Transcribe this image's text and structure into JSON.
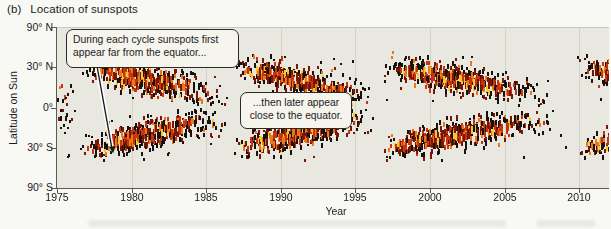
{
  "title": {
    "index": "(b)",
    "text": "Location of sunspots"
  },
  "axes": {
    "y_title": "Latitude on Sun",
    "x_title": "Year",
    "y_labels": [
      "90° N",
      "30° N",
      "0°",
      "30° S",
      "90° S"
    ],
    "x_labels": [
      "1975",
      "1980",
      "1985",
      "1990",
      "1995",
      "2000",
      "2005",
      "2010"
    ]
  },
  "annotations": {
    "first": "During each cycle sunspots first appear far from the equator...",
    "second": "...then later appear close to the equator."
  },
  "chart_data": {
    "type": "heatmap",
    "subtype": "sunspot-butterfly-diagram",
    "xlabel": "Year",
    "ylabel": "Latitude on Sun",
    "x_range": [
      1975,
      2012
    ],
    "x_ticks": [
      1975,
      1980,
      1985,
      1990,
      1995,
      2000,
      2005,
      2010
    ],
    "y_tick_labels": [
      "90° N",
      "30° N",
      "0°",
      "30° S",
      "90° S"
    ],
    "y_tick_latitudes_deg": [
      90,
      30,
      0,
      -30,
      -90
    ],
    "y_scale": "sine-of-latitude",
    "grid": "faint vertical gridlines at each 5-year tick",
    "legend": "none",
    "background": "#e9e8e0",
    "palette": {
      "smallest": "#17120d",
      "small": "#7c1604",
      "medium": "#c63410",
      "large": "#e87818",
      "largest": "#f2c82e"
    },
    "cycles": [
      {
        "cycle": 20,
        "start": 1964.8,
        "end": 1976.8,
        "note": "only low-latitude tail visible at left edge"
      },
      {
        "cycle": 21,
        "start": 1976.3,
        "end": 1986.9,
        "start_latitude_deg": 31,
        "end_latitude_deg": 6
      },
      {
        "cycle": 22,
        "start": 1986.6,
        "end": 1996.6,
        "start_latitude_deg": 31,
        "end_latitude_deg": 6
      },
      {
        "cycle": 23,
        "start": 1996.5,
        "end": 2008.7,
        "start_latitude_deg": 31,
        "end_latitude_deg": 6
      },
      {
        "cycle": 24,
        "start": 2009.6,
        "end": 2020.0,
        "note": "beginning only; chart right edge ~2012"
      }
    ],
    "annotations": [
      {
        "text": "During each cycle sunspots first appear far from the equator...",
        "points_to": {
          "year": 1978.7,
          "latitude_deg": -27
        }
      },
      {
        "text": "...then later appear close to the equator.",
        "location": {
          "year": 1989,
          "latitude_deg": 8
        }
      }
    ]
  }
}
